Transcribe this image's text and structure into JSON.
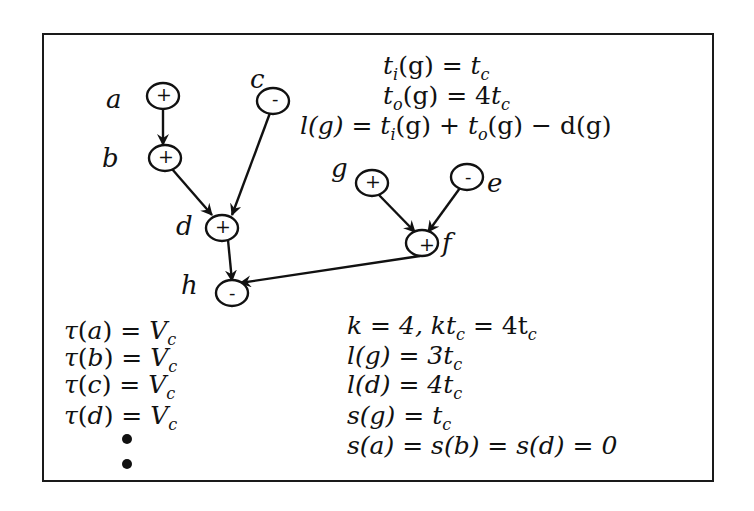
{
  "diagram": {
    "type": "signed-dataflow-graph",
    "nodes": [
      {
        "id": "a",
        "label": "a",
        "sign": "+",
        "cx": 163,
        "cy": 96
      },
      {
        "id": "b",
        "label": "b",
        "sign": "+",
        "cx": 165,
        "cy": 158
      },
      {
        "id": "c",
        "label": "c",
        "sign": "-",
        "cx": 273,
        "cy": 101
      },
      {
        "id": "d",
        "label": "d",
        "sign": "+",
        "cx": 222,
        "cy": 228
      },
      {
        "id": "h",
        "label": "h",
        "sign": "-",
        "cx": 232,
        "cy": 293
      },
      {
        "id": "g",
        "label": "g",
        "sign": "+",
        "cx": 372,
        "cy": 183
      },
      {
        "id": "e",
        "label": "e",
        "sign": "-",
        "cx": 467,
        "cy": 177
      },
      {
        "id": "f",
        "label": "f",
        "sign": "+",
        "cx": 422,
        "cy": 243
      }
    ],
    "edges": [
      {
        "from": "a",
        "to": "b"
      },
      {
        "from": "b",
        "to": "d"
      },
      {
        "from": "c",
        "to": "d"
      },
      {
        "from": "d",
        "to": "h"
      },
      {
        "from": "g",
        "to": "f"
      },
      {
        "from": "e",
        "to": "f"
      },
      {
        "from": "f",
        "to": "h"
      }
    ]
  },
  "equations_top": {
    "line1": {
      "lhs": "t",
      "lhs_sub": "i",
      "arg": "(g) = ",
      "rhs": "t",
      "rhs_sub": "c"
    },
    "line2": {
      "lhs": "t",
      "lhs_sub": "o",
      "arg": "(g) = 4",
      "rhs": "t",
      "rhs_sub": "c"
    },
    "line3_text": "l(g) = t_i(g) + t_o(g) − d(g)"
  },
  "equations_left": [
    {
      "text": "τ(a) = V_c",
      "arg": "a"
    },
    {
      "text": "τ(b) = V_c",
      "arg": "b"
    },
    {
      "text": "τ(c) = V_c",
      "arg": "c"
    },
    {
      "text": "τ(d) = V_c",
      "arg": "d"
    }
  ],
  "equations_left_continuation": "⋮",
  "equations_right": [
    "k = 4, kt_c = 4t_c",
    "l(g) = 3t_c",
    "l(d) = 4t_c",
    "s(g) = t_c",
    "s(a) = s(b) = s(d) = 0"
  ],
  "labels": {
    "a": "a",
    "b": "b",
    "c": "c",
    "d": "d",
    "e": "e",
    "f": "f",
    "g": "g",
    "h": "h",
    "plus": "+",
    "minus": "-",
    "tau": "τ",
    "V": "V",
    "c_sub": "c",
    "eq": "=",
    "k_eq": "k = 4, ",
    "kt": "kt",
    "eq4t": " = 4t",
    "lg": "l(g) = 3t",
    "ld": "l(d) = 4t",
    "sg": "s(g) = t",
    "sabd": "s(a) = s(b) = s(d) = 0",
    "ti": "t",
    "i": "i",
    "o": "o",
    "g_arg_eq": "(g) = ",
    "g_arg_eq4": "(g) = 4",
    "lg_lhs": "l(g) = ",
    "plus_op": "(g) + ",
    "minus_op": "(g) − d(g)"
  }
}
